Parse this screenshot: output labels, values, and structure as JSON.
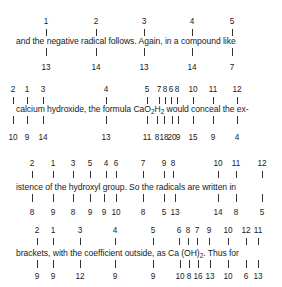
{
  "blocks": [
    {
      "text": "and the negative radical follows. Again,  in a compound like",
      "text_x": 16,
      "text_y": 36,
      "top": [
        {
          "label": "1",
          "x": 46
        },
        {
          "label": "2",
          "x": 96
        },
        {
          "label": "3",
          "x": 144
        },
        {
          "label": "4",
          "x": 192
        },
        {
          "label": "5",
          "x": 232
        }
      ],
      "bottom": [
        {
          "label": "13",
          "x": 46
        },
        {
          "label": "14",
          "x": 96
        },
        {
          "label": "13",
          "x": 144
        },
        {
          "label": "14",
          "x": 192
        },
        {
          "label": "7",
          "x": 232
        }
      ],
      "top_num_y": 17,
      "bottom_num_y": 63
    },
    {
      "text_parts": [
        "calcium hydroxide, the formula CaO",
        "2",
        "H",
        "2",
        " would conceal  the ex-"
      ],
      "text_x": 16,
      "text_y": 104,
      "top": [
        {
          "label": "2",
          "x": 13
        },
        {
          "label": "1",
          "x": 27
        },
        {
          "label": "3",
          "x": 43
        },
        {
          "label": "4",
          "x": 106
        },
        {
          "label": "5",
          "x": 147
        },
        {
          "label": "7",
          "x": 159
        },
        {
          "label": "8",
          "x": 165
        },
        {
          "label": "6",
          "x": 171
        },
        {
          "label": "8",
          "x": 177
        },
        {
          "label": "10",
          "x": 193
        },
        {
          "label": "11",
          "x": 213
        },
        {
          "label": "12",
          "x": 237
        }
      ],
      "bottom": [
        {
          "label": "10",
          "x": 13
        },
        {
          "label": "9",
          "x": 27
        },
        {
          "label": "14",
          "x": 43
        },
        {
          "label": "13",
          "x": 106
        },
        {
          "label": "11",
          "x": 147
        },
        {
          "label": "8",
          "x": 157
        },
        {
          "label": "18",
          "x": 164
        },
        {
          "label": "20",
          "x": 172
        },
        {
          "label": "9",
          "x": 178
        },
        {
          "label": "15",
          "x": 193
        },
        {
          "label": "9",
          "x": 213
        },
        {
          "label": "4",
          "x": 237
        }
      ],
      "top_num_y": 85,
      "bottom_num_y": 133
    },
    {
      "text": "istence of the hydroxyl group. So the radicals are written in",
      "text_x": 16,
      "text_y": 182,
      "top": [
        {
          "label": "2",
          "x": 32
        },
        {
          "label": "1",
          "x": 53
        },
        {
          "label": "3",
          "x": 73
        },
        {
          "label": "5",
          "x": 90
        },
        {
          "label": "4",
          "x": 106
        },
        {
          "label": "6",
          "x": 116
        },
        {
          "label": "7",
          "x": 143
        },
        {
          "label": "9",
          "x": 164
        },
        {
          "label": "8",
          "x": 173
        },
        {
          "label": "10",
          "x": 218
        },
        {
          "label": "11",
          "x": 236
        },
        {
          "label": "12",
          "x": 262
        }
      ],
      "bottom": [
        {
          "label": "8",
          "x": 32
        },
        {
          "label": "9",
          "x": 53
        },
        {
          "label": "8",
          "x": 73
        },
        {
          "label": "9",
          "x": 90
        },
        {
          "label": "9",
          "x": 104
        },
        {
          "label": "10",
          "x": 116
        },
        {
          "label": "8",
          "x": 143
        },
        {
          "label": "5",
          "x": 164
        },
        {
          "label": "13",
          "x": 175
        },
        {
          "label": "14",
          "x": 218
        },
        {
          "label": "8",
          "x": 236
        },
        {
          "label": "5",
          "x": 262
        }
      ],
      "top_num_y": 159,
      "bottom_num_y": 208
    },
    {
      "text_parts": [
        "brackets, with the coefficient outside, as Ca (OH)",
        "2",
        ".  Thus for"
      ],
      "text_x": 16,
      "text_y": 248,
      "top": [
        {
          "label": "2",
          "x": 37
        },
        {
          "label": "1",
          "x": 53
        },
        {
          "label": "3",
          "x": 80
        },
        {
          "label": "4",
          "x": 115
        },
        {
          "label": "5",
          "x": 153
        },
        {
          "label": "6",
          "x": 179
        },
        {
          "label": "8",
          "x": 188
        },
        {
          "label": "7",
          "x": 197
        },
        {
          "label": "9",
          "x": 209
        },
        {
          "label": "10",
          "x": 228
        },
        {
          "label": "12",
          "x": 246
        },
        {
          "label": "11",
          "x": 258
        }
      ],
      "bottom": [
        {
          "label": "9",
          "x": 37
        },
        {
          "label": "9",
          "x": 53
        },
        {
          "label": "12",
          "x": 80
        },
        {
          "label": "9",
          "x": 115
        },
        {
          "label": "9",
          "x": 153
        },
        {
          "label": "10",
          "x": 180
        },
        {
          "label": "8",
          "x": 189
        },
        {
          "label": "16",
          "x": 198
        },
        {
          "label": "13",
          "x": 210
        },
        {
          "label": "10",
          "x": 228
        },
        {
          "label": "6",
          "x": 246
        },
        {
          "label": "13",
          "x": 258
        }
      ],
      "top_num_y": 226,
      "bottom_num_y": 272
    }
  ]
}
